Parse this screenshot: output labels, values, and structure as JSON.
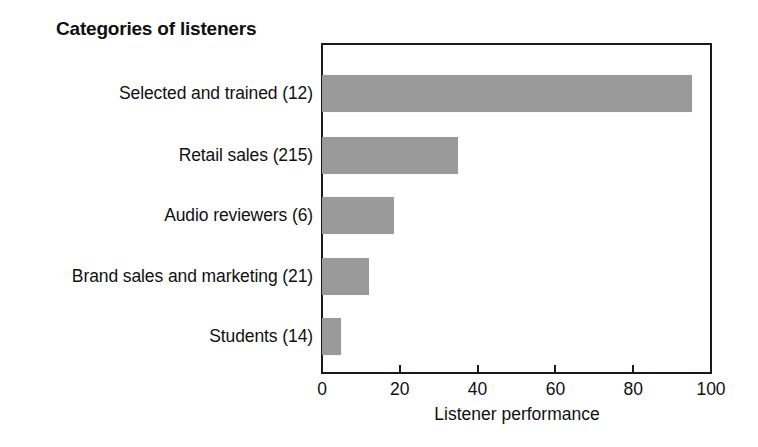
{
  "chart_data": {
    "type": "bar",
    "orientation": "horizontal",
    "title": "Categories of listeners",
    "xlabel": "Listener performance",
    "ylabel": "",
    "categories": [
      "Selected and trained (12)",
      "Retail sales (215)",
      "Audio reviewers (6)",
      "Brand sales and marketing (21)",
      "Students (14)"
    ],
    "values": [
      95,
      35,
      18.5,
      12,
      5
    ],
    "xlim": [
      0,
      100
    ],
    "xticks": [
      0,
      20,
      40,
      60,
      80,
      100
    ],
    "xtick_labels": [
      "0",
      "20",
      "40",
      "60",
      "80",
      "100"
    ],
    "grid": false,
    "legend": "none",
    "bar_color": "#9a9a9a",
    "axis_color": "#1a1a1a",
    "background_color": "#ffffff"
  }
}
